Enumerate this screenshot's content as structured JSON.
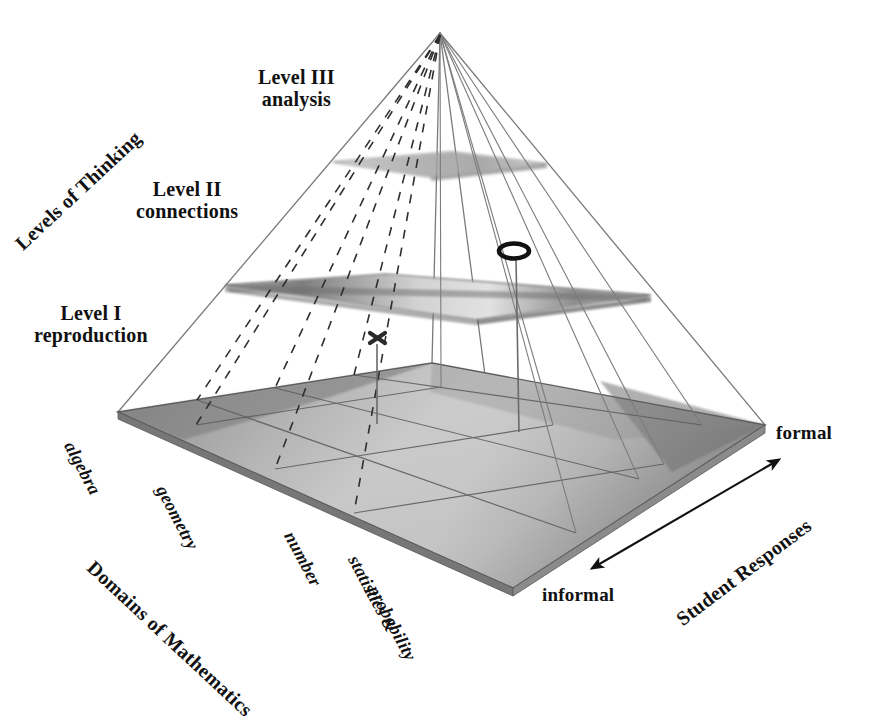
{
  "figure": {
    "type": "3d-pyramid-diagram",
    "background_color": "#ffffff",
    "ink_color": "#111111"
  },
  "axes": {
    "vertical": {
      "name": "Levels of Thinking",
      "label": "Levels of Thinking",
      "rotation_deg": -43,
      "levels": [
        {
          "id": "level-1",
          "name": "Level I",
          "descriptor": "reproduction"
        },
        {
          "id": "level-2",
          "name": "Level II",
          "descriptor": "connections"
        },
        {
          "id": "level-3",
          "name": "Level III",
          "descriptor": "analysis"
        }
      ]
    },
    "depth": {
      "name": "Domains of Mathematics",
      "label": "Domains of Mathematics",
      "rotation_deg": 43,
      "domains": [
        {
          "id": "algebra",
          "label": "algebra"
        },
        {
          "id": "geometry",
          "label": "geometry"
        },
        {
          "id": "number",
          "label": "number"
        },
        {
          "id": "statistics-probability",
          "label": "statistics &",
          "label_line2": "probability"
        }
      ]
    },
    "horizontal": {
      "name": "Student Responses",
      "label": "Student Responses",
      "rotation_deg": 37,
      "low_end": "informal",
      "high_end": "formal"
    }
  },
  "markers": [
    {
      "id": "marker-x",
      "glyph": "X",
      "shape": "x-cross",
      "level": "between Level I and Level II"
    },
    {
      "id": "marker-o",
      "glyph": "O",
      "shape": "oval-ring",
      "level": "above Level II plane"
    }
  ],
  "planes": [
    {
      "id": "base-plane",
      "level": "Level I reproduction",
      "shaded": true
    },
    {
      "id": "middle-plane",
      "level": "Level II connections",
      "shaded": true
    },
    {
      "id": "top-plane",
      "level": "Level III analysis",
      "shaded": true
    }
  ],
  "colors": {
    "outline": "#6d6d6d",
    "dashed": "#2b2b2b",
    "base_fill_light": "#c9c9c9",
    "base_fill_mid": "#b0b0b0",
    "base_fill_dark": "#8c8c8c",
    "plane_fill": "#9d9d9d",
    "plane_fill_light": "#d6d6d6",
    "edge_dark": "#6a6a6a",
    "text": "#111111"
  }
}
